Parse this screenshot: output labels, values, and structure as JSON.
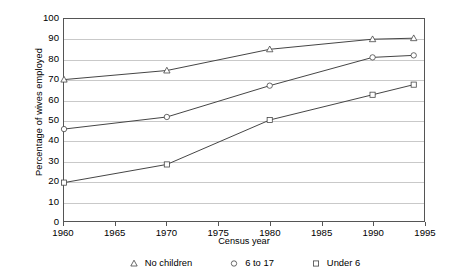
{
  "chart_data": {
    "type": "line",
    "title": "",
    "xlabel": "Census year",
    "ylabel": "Percentage of wives employed",
    "x": [
      1960,
      1970,
      1980,
      1990,
      1994
    ],
    "xlim": [
      1960,
      1995
    ],
    "ylim": [
      0,
      100
    ],
    "xticks": [
      1960,
      1965,
      1970,
      1975,
      1980,
      1985,
      1990,
      1995
    ],
    "yticks": [
      0,
      10,
      20,
      30,
      40,
      50,
      60,
      70,
      80,
      90,
      100
    ],
    "grid": "horizontal",
    "legend_position": "bottom",
    "series": [
      {
        "name": "No children",
        "marker": "triangle",
        "values": [
          70,
          74.5,
          85,
          90,
          90.5
        ]
      },
      {
        "name": "6 to 17",
        "marker": "circle",
        "values": [
          45.5,
          51.5,
          67,
          81,
          82
        ]
      },
      {
        "name": "Under 6",
        "marker": "square",
        "values": [
          19,
          28,
          50,
          62.5,
          67.5
        ]
      }
    ]
  },
  "axes": {
    "y_title": "Percentage of wives employed",
    "x_title": "Census year",
    "y_tick_labels": [
      "100",
      "90",
      "80",
      "70",
      "60",
      "50",
      "40",
      "30",
      "20",
      "10",
      "0"
    ],
    "x_tick_labels": [
      "1960",
      "1965",
      "1970",
      "1975",
      "1980",
      "1985",
      "1990",
      "1995"
    ]
  },
  "legend": {
    "items": [
      {
        "label": "No children",
        "marker": "triangle-marker"
      },
      {
        "label": "6 to 17",
        "marker": "circle-marker"
      },
      {
        "label": "Under 6",
        "marker": "square-marker"
      }
    ]
  },
  "colors": {
    "line": "#444444",
    "grid": "#c9c9c9",
    "frame": "#555555",
    "text": "#000000",
    "marker_fill": "#ffffff"
  }
}
